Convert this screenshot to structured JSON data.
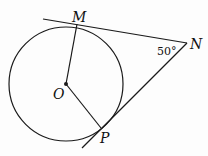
{
  "diagram": {
    "type": "geometry",
    "points": {
      "M": {
        "label": "M",
        "x": 77,
        "y": 24
      },
      "N": {
        "label": "N",
        "x": 187,
        "y": 43
      },
      "O": {
        "label": "O",
        "x": 66,
        "y": 84
      },
      "P": {
        "label": "P",
        "x": 101,
        "y": 128
      }
    },
    "angle_label": "50°",
    "circle": {
      "cx": 66,
      "cy": 84,
      "r": 57
    },
    "stroke_color": "#1a1a1a"
  }
}
